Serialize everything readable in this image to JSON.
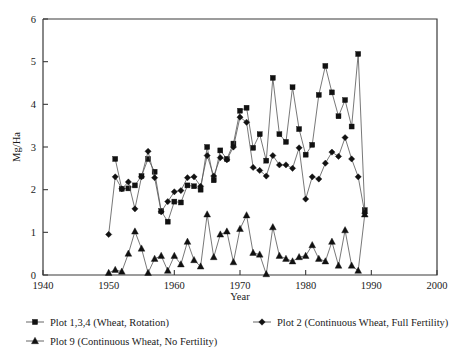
{
  "chart_data": {
    "type": "line",
    "title": "",
    "xlabel": "Year",
    "ylabel": "Mg/Ha",
    "xlim": [
      1940,
      2000
    ],
    "ylim": [
      0,
      6
    ],
    "xticks": [
      1940,
      1950,
      1960,
      1970,
      1980,
      1990,
      2000
    ],
    "yticks": [
      0,
      1,
      2,
      3,
      4,
      5,
      6
    ],
    "xtick_labels": [
      "1940",
      "1950",
      "1960",
      "1970",
      "1980",
      "1990",
      "2000"
    ],
    "ytick_labels": [
      "0",
      "1",
      "2",
      "3",
      "4",
      "5",
      "6"
    ],
    "grid": false,
    "legend_position": "below",
    "series": [
      {
        "name": "Plot 1,3,4 (Wheat, Rotation)",
        "marker": "square",
        "color": "#111111",
        "x": [
          1951,
          1952,
          1953,
          1954,
          1955,
          1956,
          1957,
          1958,
          1959,
          1960,
          1961,
          1962,
          1963,
          1964,
          1965,
          1966,
          1967,
          1968,
          1969,
          1970,
          1971,
          1972,
          1973,
          1974,
          1975,
          1976,
          1977,
          1978,
          1979,
          1980,
          1981,
          1982,
          1983,
          1984,
          1985,
          1986,
          1987,
          1988,
          1989
        ],
        "y": [
          2.72,
          2.02,
          2.03,
          2.1,
          2.32,
          2.72,
          2.42,
          1.5,
          1.25,
          1.72,
          1.7,
          2.1,
          2.08,
          2.0,
          3.0,
          2.22,
          2.92,
          2.72,
          3.08,
          3.85,
          3.92,
          2.98,
          3.3,
          2.68,
          4.62,
          3.3,
          3.12,
          4.4,
          3.42,
          2.82,
          3.05,
          4.22,
          4.9,
          4.28,
          3.72,
          4.1,
          3.48,
          5.18,
          1.52
        ]
      },
      {
        "name": "Plot 2 (Continuous Wheat, Full Fertility)",
        "marker": "diamond",
        "color": "#111111",
        "x": [
          1950,
          1951,
          1952,
          1953,
          1954,
          1955,
          1956,
          1957,
          1958,
          1959,
          1960,
          1961,
          1962,
          1963,
          1964,
          1965,
          1966,
          1967,
          1968,
          1969,
          1970,
          1971,
          1972,
          1973,
          1974,
          1975,
          1976,
          1977,
          1978,
          1979,
          1980,
          1981,
          1982,
          1983,
          1984,
          1985,
          1986,
          1987,
          1988,
          1989
        ],
        "y": [
          0.95,
          2.3,
          2.02,
          2.18,
          1.55,
          2.3,
          2.9,
          2.28,
          1.48,
          1.72,
          1.95,
          1.98,
          2.28,
          2.3,
          2.08,
          2.8,
          2.32,
          2.75,
          2.7,
          3.0,
          3.7,
          3.58,
          2.52,
          2.45,
          2.32,
          2.8,
          2.58,
          2.58,
          2.5,
          2.98,
          1.78,
          2.3,
          2.25,
          2.62,
          2.88,
          2.78,
          3.22,
          2.72,
          2.3,
          1.45
        ]
      },
      {
        "name": "Plot 9 (Continuous Wheat, No Fertility)",
        "marker": "triangle",
        "color": "#111111",
        "x": [
          1950,
          1951,
          1952,
          1953,
          1954,
          1955,
          1956,
          1957,
          1958,
          1959,
          1960,
          1961,
          1962,
          1963,
          1964,
          1965,
          1966,
          1967,
          1968,
          1969,
          1970,
          1971,
          1972,
          1973,
          1974,
          1975,
          1976,
          1977,
          1978,
          1979,
          1980,
          1981,
          1982,
          1983,
          1984,
          1985,
          1986,
          1987,
          1988,
          1989
        ],
        "y": [
          0.05,
          0.12,
          0.08,
          0.5,
          1.02,
          0.62,
          0.05,
          0.38,
          0.45,
          0.1,
          0.45,
          0.25,
          0.78,
          0.35,
          0.2,
          1.42,
          0.42,
          0.95,
          1.02,
          0.3,
          1.08,
          1.4,
          0.52,
          0.48,
          0.02,
          1.12,
          0.45,
          0.38,
          0.32,
          0.42,
          0.45,
          0.7,
          0.38,
          0.32,
          0.78,
          0.22,
          1.05,
          0.22,
          0.1,
          1.42
        ]
      }
    ]
  },
  "legend": {
    "items": [
      {
        "label": "Plot 1,3,4 (Wheat, Rotation)",
        "marker": "square"
      },
      {
        "label": "Plot 2 (Continuous Wheat, Full Fertility)",
        "marker": "diamond"
      },
      {
        "label": "Plot 9 (Continuous Wheat, No Fertility)",
        "marker": "triangle"
      }
    ]
  }
}
